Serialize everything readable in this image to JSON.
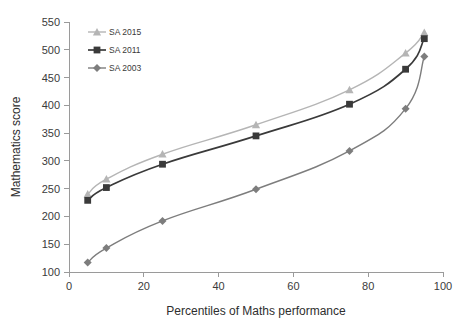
{
  "chart_data": {
    "type": "line",
    "title": "",
    "subtitle": "",
    "xlabel": "Percentiles of Maths performance",
    "ylabel": "Mathematics score",
    "x": [
      5,
      10,
      25,
      50,
      75,
      90,
      95
    ],
    "xlim": [
      0,
      100
    ],
    "ylim": [
      100,
      550
    ],
    "xticks": [
      0,
      20,
      40,
      60,
      80,
      100
    ],
    "yticks": [
      100,
      150,
      200,
      250,
      300,
      350,
      400,
      450,
      500,
      550
    ],
    "grid": false,
    "legend_position": "top-left",
    "series": [
      {
        "name": "SA 2015",
        "marker": "triangle",
        "color": "#b5b5b5",
        "values": [
          240,
          267,
          312,
          365,
          428,
          494,
          531
        ]
      },
      {
        "name": "SA 2011",
        "marker": "square",
        "color": "#3a3a3a",
        "values": [
          229,
          252,
          294,
          345,
          402,
          465,
          520
        ]
      },
      {
        "name": "SA 2003",
        "marker": "diamond",
        "color": "#7d7d7d",
        "values": [
          117,
          143,
          192,
          249,
          318,
          394,
          488
        ]
      }
    ]
  },
  "axis": {
    "y_tick_labels": [
      "550",
      "500",
      "450",
      "400",
      "350",
      "300",
      "250",
      "200",
      "150",
      "100"
    ],
    "x_tick_labels": [
      "0",
      "20",
      "40",
      "60",
      "80",
      "100"
    ],
    "y_title": "Mathematics score",
    "x_title": "Percentiles of Maths performance"
  },
  "legend": {
    "entries": [
      {
        "label": "SA 2015"
      },
      {
        "label": "SA 2011"
      },
      {
        "label": "SA 2003"
      }
    ]
  },
  "colors": {
    "series_2015": "#b5b5b5",
    "series_2011": "#3a3a3a",
    "series_2003": "#7d7d7d",
    "axis": "#9a9a9a",
    "text": "#3b3b3b",
    "background": "#ffffff"
  }
}
